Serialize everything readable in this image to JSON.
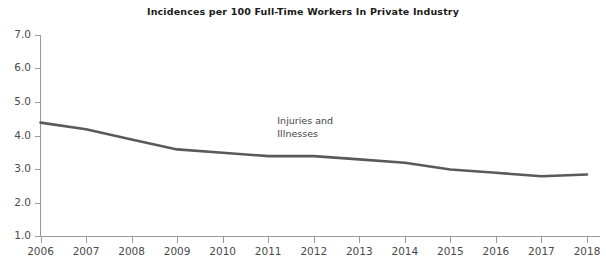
{
  "chart_data": {
    "type": "line",
    "title": "Incidences per 100 Full-Time Workers In Private Industry",
    "xlabel": "",
    "ylabel": "",
    "categories": [
      "2006",
      "2007",
      "2008",
      "2009",
      "2010",
      "2011",
      "2012",
      "2013",
      "2014",
      "2015",
      "2016",
      "2017",
      "2018"
    ],
    "x": [
      2006,
      2007,
      2008,
      2009,
      2010,
      2011,
      2012,
      2013,
      2014,
      2015,
      2016,
      2017,
      2018
    ],
    "series": [
      {
        "name": "Injuries and Illnesses",
        "values": [
          4.4,
          4.2,
          3.9,
          3.6,
          3.5,
          3.4,
          3.4,
          3.3,
          3.2,
          3.0,
          2.9,
          2.8,
          2.85
        ],
        "color": "#5a5a5a"
      }
    ],
    "ylim": [
      0,
      7.0
    ],
    "xlim": [
      2006,
      2018
    ],
    "yticks": [
      1.0,
      2.0,
      3.0,
      4.0,
      5.0,
      6.0,
      7.0
    ],
    "ytick_labels": [
      "1.0",
      "2.0",
      "3.0",
      "4.0",
      "5.0",
      "6.0",
      "7.0"
    ],
    "grid": false,
    "legend": "none",
    "annotations": [
      {
        "name": "series-label",
        "lines": [
          "Injuries and",
          "Illnesses"
        ],
        "x": 2011.2,
        "y": 4.35
      }
    ]
  },
  "axis": {
    "line_color": "#9a9a9a"
  }
}
